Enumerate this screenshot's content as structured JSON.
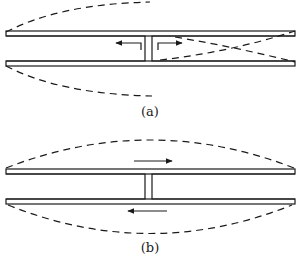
{
  "figure": {
    "panels": [
      {
        "id": "a",
        "label": "(a)",
        "description": "Two parallel plates joined by a central gap; dashed mode shape with antisymmetric lobes on the left and crossing field lines on the right; arrows point outward from center",
        "arrows": [
          {
            "direction": "left",
            "position": "left-of-center, inside gap"
          },
          {
            "direction": "right",
            "position": "right-of-center, inside gap"
          }
        ]
      },
      {
        "id": "b",
        "label": "(b)",
        "description": "Two parallel plates joined by a central gap; dashed symmetric arcs above and below; arrows showing opposite current flow on top and bottom",
        "arrows": [
          {
            "direction": "right",
            "position": "above top plate"
          },
          {
            "direction": "left",
            "position": "below bottom plate"
          }
        ]
      }
    ]
  },
  "colors": {
    "line": "#1a1a1a",
    "background": "#ffffff"
  }
}
